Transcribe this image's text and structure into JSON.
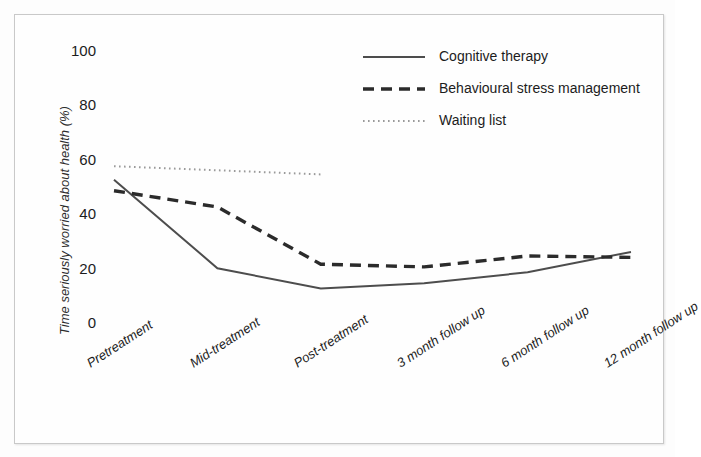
{
  "chart_data": {
    "type": "line",
    "title": "",
    "xlabel": "",
    "ylabel": "Time seriously worried about health (%)",
    "categories": [
      "Pretreatment",
      "Mid-treatment",
      "Post-treatment",
      "3 month follow up",
      "6 month follow up",
      "12 month follow up"
    ],
    "ylim": [
      0,
      100
    ],
    "yticks": [
      0,
      20,
      40,
      60,
      80,
      100
    ],
    "grid": false,
    "legend_position": "top-right",
    "series": [
      {
        "name": "Cognitive therapy",
        "style": "solid",
        "color": "#4d4d4d",
        "values": [
          53,
          20.5,
          13,
          15,
          19,
          26.5
        ]
      },
      {
        "name": "Behavioural stress management",
        "style": "dashed",
        "color": "#2b2b2b",
        "values": [
          49,
          43,
          22,
          21,
          25,
          24.5
        ]
      },
      {
        "name": "Waiting list",
        "style": "dotted",
        "color": "#9a9a9a",
        "values": [
          58,
          56.5,
          55,
          null,
          null,
          null
        ]
      }
    ]
  },
  "yaxis": {
    "title": "Time seriously worried about health (%)",
    "ticks": [
      "0",
      "20",
      "40",
      "60",
      "80",
      "100"
    ]
  },
  "xaxis": {
    "ticks": [
      "Pretreatment",
      "Mid-treatment",
      "Post-treatment",
      "3 month follow up",
      "6 month follow up",
      "12 month follow up"
    ]
  },
  "legend": {
    "items": [
      {
        "label": "Cognitive therapy",
        "style": "solid"
      },
      {
        "label": "Behavioural stress management",
        "style": "dashed"
      },
      {
        "label": "Waiting list",
        "style": "dotted"
      }
    ]
  }
}
